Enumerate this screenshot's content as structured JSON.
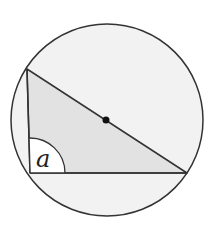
{
  "diagram": {
    "type": "geometry",
    "circle": {
      "cx": 107,
      "cy": 120,
      "r": 96,
      "fill": "#f2f2f2",
      "stroke": "#333333"
    },
    "center_dot": {
      "x": 106,
      "y": 120,
      "r": 3.5,
      "fill": "#111111"
    },
    "triangle": {
      "vertices": [
        [
          27,
          69
        ],
        [
          30,
          173
        ],
        [
          187,
          173
        ]
      ],
      "fill": "#e2e2e2",
      "stroke": "#333333"
    },
    "angle_marker": {
      "vertex": [
        30,
        173
      ],
      "radius": 35,
      "fill": "#ffffff",
      "label": "a"
    }
  }
}
